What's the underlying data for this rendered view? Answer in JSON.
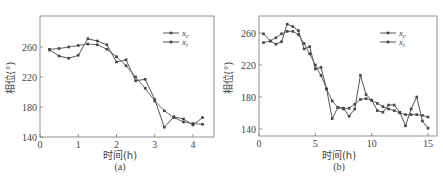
{
  "chart_data": [
    {
      "id": "a",
      "type": "line",
      "caption": "(a)",
      "xlabel": "时间(h)",
      "ylabel": "相位(°)",
      "xlim": [
        0,
        4.4
      ],
      "ylim": [
        140,
        290
      ],
      "xticks": [
        0,
        1,
        2,
        3,
        4
      ],
      "yticks": [
        140,
        180,
        220,
        260
      ],
      "legend": {
        "position": "upper right",
        "entries": [
          "x_c",
          "x_t"
        ]
      },
      "series": [
        {
          "name": "x_c",
          "x": [
            0.25,
            0.5,
            0.75,
            1.0,
            1.25,
            1.5,
            1.75,
            2.0,
            2.25,
            2.5,
            2.75,
            3.0,
            3.25,
            3.5,
            3.75,
            4.0,
            4.25
          ],
          "values": [
            256,
            248,
            245,
            249,
            271,
            268,
            263,
            240,
            243,
            215,
            217,
            190,
            153,
            167,
            164,
            156,
            166
          ]
        },
        {
          "name": "x_t",
          "x": [
            0.25,
            0.5,
            0.75,
            1.0,
            1.25,
            1.5,
            1.75,
            2.0,
            2.25,
            2.5,
            2.75,
            3.0,
            3.25,
            3.5,
            3.75,
            4.0,
            4.25
          ],
          "values": [
            257,
            258,
            260,
            262,
            264,
            263,
            257,
            247,
            235,
            220,
            205,
            188,
            175,
            166,
            160,
            158,
            157
          ]
        }
      ]
    },
    {
      "id": "b",
      "type": "line",
      "caption": "(b)",
      "xlabel": "时间(h)",
      "ylabel": "相位(°)",
      "xlim": [
        0,
        15.5
      ],
      "ylim": [
        130,
        280
      ],
      "xticks": [
        0,
        5,
        10,
        15
      ],
      "yticks": [
        140,
        180,
        220,
        260
      ],
      "legend": {
        "position": "upper right",
        "entries": [
          "x_c",
          "x_t"
        ]
      },
      "series": [
        {
          "name": "x_c",
          "x": [
            0.4,
            1,
            1.5,
            2,
            2.5,
            3,
            3.5,
            4,
            4.5,
            5,
            5.5,
            6,
            6.5,
            7,
            7.5,
            8,
            8.5,
            9,
            9.5,
            10,
            10.5,
            11,
            11.5,
            12,
            12.5,
            13,
            13.5,
            14,
            14.5,
            15
          ],
          "values": [
            259,
            250,
            246,
            249,
            271,
            268,
            263,
            240,
            243,
            215,
            217,
            190,
            153,
            167,
            166,
            156,
            165,
            207,
            183,
            176,
            163,
            161,
            170,
            170,
            161,
            144,
            165,
            180,
            150,
            141
          ]
        },
        {
          "name": "x_t",
          "x": [
            0.4,
            1,
            1.5,
            2,
            2.5,
            3,
            3.5,
            4,
            4.5,
            5,
            5.5,
            6,
            6.5,
            7,
            7.5,
            8,
            8.5,
            9,
            9.5,
            10,
            10.5,
            11,
            11.5,
            12,
            12.5,
            13,
            13.5,
            14,
            14.5,
            15
          ],
          "values": [
            248,
            250,
            254,
            259,
            262,
            262,
            258,
            247,
            234,
            220,
            207,
            190,
            175,
            167,
            165,
            166,
            171,
            177,
            178,
            176,
            172,
            168,
            165,
            163,
            160,
            158,
            158,
            158,
            157,
            155
          ]
        }
      ]
    }
  ],
  "legend_labels": {
    "xc_main": "x",
    "xc_sub": "c",
    "xt_main": "x",
    "xt_sub": "t"
  }
}
